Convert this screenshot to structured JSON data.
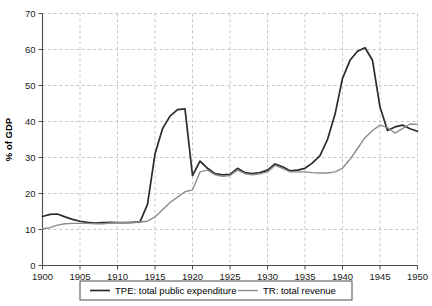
{
  "chart_data": {
    "type": "line",
    "title": "",
    "xlabel": "",
    "ylabel": "% of GDP",
    "xlim": [
      1900,
      1950
    ],
    "ylim": [
      0,
      70
    ],
    "xticks": [
      1900,
      1905,
      1910,
      1915,
      1920,
      1925,
      1930,
      1935,
      1940,
      1945,
      1950
    ],
    "yticks": [
      0,
      10,
      20,
      30,
      40,
      50,
      60,
      70
    ],
    "grid": true,
    "legend_position": "below-axis",
    "x": [
      1900,
      1901,
      1902,
      1903,
      1904,
      1905,
      1906,
      1907,
      1908,
      1909,
      1910,
      1911,
      1912,
      1913,
      1914,
      1915,
      1916,
      1917,
      1918,
      1919,
      1920,
      1921,
      1922,
      1923,
      1924,
      1925,
      1926,
      1927,
      1928,
      1929,
      1930,
      1931,
      1932,
      1933,
      1934,
      1935,
      1936,
      1937,
      1938,
      1939,
      1940,
      1941,
      1942,
      1943,
      1944,
      1945,
      1946,
      1947,
      1948,
      1949,
      1950
    ],
    "series": [
      {
        "name": "TPE: total public expenditure",
        "label": "TPE: total public expenditure",
        "color": "#2b2b2b",
        "width": 1.7,
        "values": [
          13.6,
          14.2,
          14.3,
          13.5,
          12.8,
          12.3,
          12.0,
          11.8,
          11.9,
          12.0,
          11.9,
          11.9,
          12.0,
          12.1,
          17.0,
          31.0,
          38.0,
          41.5,
          43.3,
          43.5,
          25.0,
          29.0,
          27.0,
          25.5,
          25.2,
          25.3,
          27.0,
          25.8,
          25.5,
          25.8,
          26.5,
          28.2,
          27.4,
          26.3,
          26.5,
          27.0,
          28.5,
          30.5,
          35.0,
          42.0,
          52.0,
          57.0,
          59.5,
          60.5,
          57.0,
          44.0,
          37.5,
          38.5,
          39.0,
          38.0,
          37.3
        ]
      },
      {
        "name": "TR: total revenue",
        "label": "TR: total revenue",
        "color": "#8c8c8c",
        "width": 1.4,
        "values": [
          10.2,
          10.5,
          11.2,
          11.6,
          11.7,
          11.7,
          11.7,
          11.6,
          11.6,
          11.8,
          11.9,
          11.9,
          11.9,
          12.1,
          12.3,
          13.5,
          15.5,
          17.5,
          19.0,
          20.5,
          21.0,
          26.0,
          26.5,
          25.2,
          24.8,
          25.0,
          26.5,
          25.5,
          25.2,
          25.5,
          26.0,
          27.8,
          27.0,
          26.0,
          26.0,
          26.0,
          25.8,
          25.7,
          25.7,
          26.0,
          27.0,
          29.5,
          32.5,
          35.5,
          37.5,
          39.0,
          38.3,
          36.8,
          38.0,
          39.3,
          39.2
        ]
      }
    ]
  },
  "axis": {
    "ylabel": "% of GDP",
    "ytick_labels": [
      "0",
      "10",
      "20",
      "30",
      "40",
      "50",
      "60",
      "70"
    ],
    "xtick_labels": [
      "1900",
      "1905",
      "1910",
      "1915",
      "1920",
      "1925",
      "1930",
      "1935",
      "1940",
      "1945",
      "1950"
    ]
  },
  "legend": {
    "items": [
      {
        "label": "TPE: total public expenditure",
        "color": "#2b2b2b"
      },
      {
        "label": "TR: total revenue",
        "color": "#8c8c8c"
      }
    ]
  }
}
